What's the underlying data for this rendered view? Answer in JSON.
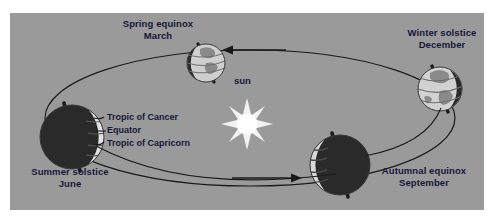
{
  "diagram": {
    "background_color": "#9a9a9a",
    "page_color": "#ffffff",
    "text_color": "#17173a",
    "orbit_color": "#1a1a1a",
    "sun": {
      "label": "sun",
      "color": "#ffffff",
      "glow_color": "#e8e8e8",
      "rays": 8,
      "cx": 237,
      "cy": 111
    },
    "positions": [
      {
        "id": "spring-equinox",
        "label_line1": "Spring equinox",
        "label_line2": "March",
        "lit_side": "front",
        "cx": 196,
        "cy": 50,
        "r": 19
      },
      {
        "id": "winter-solstice",
        "label_line1": "Winter solstice",
        "label_line2": "December",
        "lit_side": "left",
        "cx": 430,
        "cy": 76,
        "r": 22
      },
      {
        "id": "autumnal-equinox",
        "label_line1": "Autumnal equinox",
        "label_line2": "September",
        "lit_side": "left",
        "cx": 330,
        "cy": 152,
        "r": 30
      },
      {
        "id": "summer-solstice",
        "label_line1": "Summer solstice",
        "label_line2": "June",
        "lit_side": "right",
        "cx": 62,
        "cy": 124,
        "r": 32
      }
    ],
    "annotations": [
      {
        "id": "tropic-of-cancer",
        "label": "Tropic of Cancer"
      },
      {
        "id": "equator",
        "label": "Equator"
      },
      {
        "id": "tropic-of-capricorn",
        "label": "Tropic of Capricorn"
      }
    ],
    "arrows": [
      {
        "id": "arrow-to-spring",
        "direction": "left"
      },
      {
        "id": "arrow-to-autumn",
        "direction": "right"
      }
    ]
  }
}
